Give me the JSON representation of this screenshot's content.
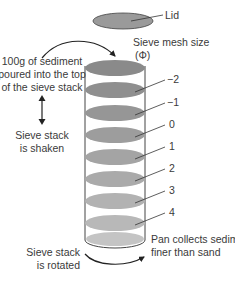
{
  "diagram": {
    "lid_label": "Lid",
    "mesh_size_label_line1": "Sieve mesh size",
    "mesh_size_label_line2": "(Φ)",
    "pour_label_line1": "100g of sediment",
    "pour_label_line2": "poured into the top",
    "pour_label_line3": "of the sieve stack",
    "shake_label_line1": "Sieve stack",
    "shake_label_line2": "is shaken",
    "rotate_label_line1": "Sieve stack",
    "rotate_label_line2": "is rotated",
    "pan_label_line1": "Pan collects sediment",
    "pan_label_line2": "finer than sand",
    "sieves": [
      {
        "phi": "−2",
        "color": "#8f8f8f"
      },
      {
        "phi": "−1",
        "color": "#969696"
      },
      {
        "phi": "0",
        "color": "#9d9d9d"
      },
      {
        "phi": "1",
        "color": "#a4a4a4"
      },
      {
        "phi": "2",
        "color": "#aaaaaa"
      },
      {
        "phi": "3",
        "color": "#b2b2b2"
      },
      {
        "phi": "4",
        "color": "#b8b8b8"
      }
    ],
    "colors": {
      "lid": "#9a9a9a",
      "top_sediment": "#8a8a8a",
      "pan": "#c4c4c4",
      "outline": "#444444",
      "text": "#3a3a3a"
    }
  }
}
